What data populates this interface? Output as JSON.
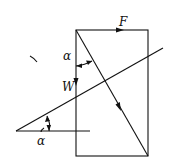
{
  "diagram": {
    "type": "force-triangle",
    "labels": {
      "force_f": "F",
      "weight": "W",
      "angle_top": "α",
      "angle_bottom": "α"
    },
    "stroke_color": "#111111",
    "background": "#ffffff"
  }
}
